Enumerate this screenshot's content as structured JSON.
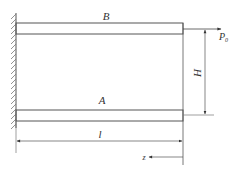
{
  "diagram": {
    "type": "cantilevered two-beam structure",
    "labels": {
      "top_beam": "B",
      "bottom_beam": "A",
      "load": "P",
      "load_subscript": "0",
      "height_dim": "H",
      "length_dim": "l",
      "axis": "z"
    },
    "colors": {
      "line": "#555555",
      "text": "#333333",
      "background": "#ffffff"
    }
  }
}
